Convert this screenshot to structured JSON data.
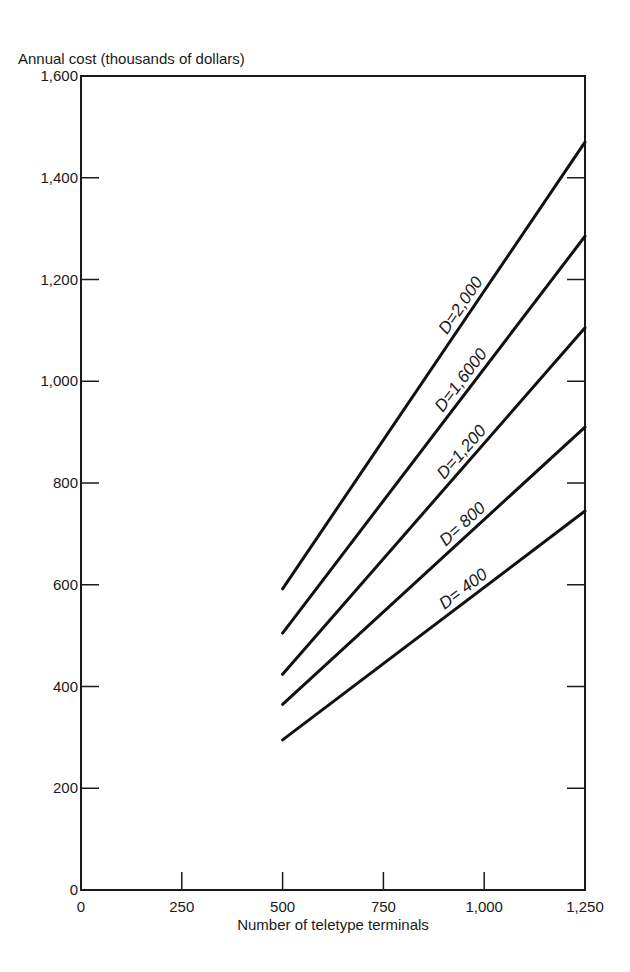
{
  "chart_data": {
    "type": "line",
    "title": "",
    "xlabel": "Number of teletype terminals",
    "ylabel": "Annual cost (thousands of dollars)",
    "xlim": [
      0,
      1250
    ],
    "ylim": [
      0,
      1600
    ],
    "x_ticks": [
      0,
      250,
      500,
      750,
      1000,
      1250
    ],
    "x_tick_labels": [
      "0",
      "250",
      "500",
      "750",
      "1,000",
      "1,250"
    ],
    "y_ticks": [
      0,
      200,
      400,
      600,
      800,
      1000,
      1200,
      1400,
      1600
    ],
    "y_tick_labels": [
      "0",
      "200",
      "400",
      "600",
      "800",
      "1,000",
      "1,200",
      "1,400",
      "1,600"
    ],
    "grid": false,
    "legend": "inline labels along lines",
    "series": [
      {
        "name": "D=2,000",
        "label": "D=2,000",
        "x": [
          500,
          1250
        ],
        "y": [
          592,
          1470
        ]
      },
      {
        "name": "D=1,6000",
        "label": "D=1,6000",
        "x": [
          500,
          1250
        ],
        "y": [
          505,
          1285
        ]
      },
      {
        "name": "D=1,200",
        "label": "D=1,200",
        "x": [
          500,
          1250
        ],
        "y": [
          424,
          1105
        ]
      },
      {
        "name": "D=800",
        "label": "D= 800",
        "x": [
          500,
          1250
        ],
        "y": [
          365,
          910
        ]
      },
      {
        "name": "D=400",
        "label": "D= 400",
        "x": [
          500,
          1250
        ],
        "y": [
          295,
          745
        ]
      }
    ]
  }
}
